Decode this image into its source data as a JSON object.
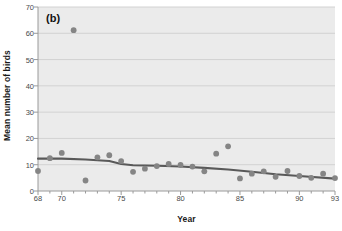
{
  "chart_data": {
    "type": "scatter",
    "title": "(b)",
    "panel_label": "(b)",
    "xlabel": "Year",
    "ylabel": "Mean number of birds",
    "xlim": [
      68,
      93
    ],
    "ylim": [
      0,
      70
    ],
    "xticks": [
      68,
      70,
      75,
      80,
      85,
      90,
      93
    ],
    "xtick_labels": [
      "68",
      "70",
      "75",
      "80",
      "85",
      "90",
      "93"
    ],
    "xminor_step": 1,
    "yticks": [
      0,
      10,
      20,
      30,
      40,
      50,
      60,
      70
    ],
    "ytick_labels": [
      "0",
      "10",
      "20",
      "30",
      "40",
      "50",
      "60",
      "70"
    ],
    "grid": "horizontal",
    "legend": "none",
    "plot_bg": "#ebebeb",
    "point_color": "#858585",
    "line_color": "#595959",
    "grid_color": "#d2d2d2",
    "marker": "circle",
    "marker_size": 5,
    "series": [
      {
        "name": "Mean number of birds",
        "x": [
          68,
          69,
          70,
          71,
          72,
          73,
          74,
          75,
          76,
          77,
          78,
          79,
          80,
          81,
          82,
          83,
          84,
          85,
          86,
          87,
          88,
          89,
          90,
          91,
          92,
          93
        ],
        "y": [
          7.6,
          12.5,
          14.5,
          61.2,
          4.0,
          12.8,
          13.6,
          11.4,
          7.3,
          8.5,
          9.5,
          10.3,
          9.9,
          9.3,
          7.5,
          14.2,
          17.0,
          4.8,
          6.6,
          7.5,
          5.4,
          7.6,
          5.7,
          5.0,
          6.6,
          4.9
        ]
      }
    ],
    "trend_line": {
      "name": "smoothed-trend",
      "x": [
        68,
        70,
        72,
        74,
        75,
        76,
        78,
        80,
        82,
        84,
        86,
        88,
        90,
        93
      ],
      "y": [
        12.3,
        12.3,
        12.0,
        11.4,
        10.3,
        9.8,
        9.6,
        9.3,
        8.8,
        8.2,
        7.3,
        6.4,
        5.7,
        4.7
      ]
    }
  }
}
